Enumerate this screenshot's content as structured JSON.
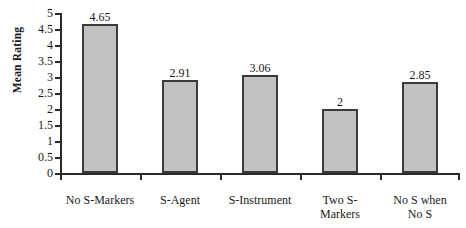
{
  "chart_data": {
    "type": "bar",
    "title": "",
    "xlabel": "",
    "ylabel": "Mean Rating",
    "ylim": [
      0,
      5
    ],
    "ytick_labels": [
      "5",
      "4.5",
      "4",
      "3.5",
      "3",
      "2.5",
      "2",
      "1.5",
      "1",
      "0.5",
      "0"
    ],
    "ytick_values": [
      5,
      4.5,
      4,
      3.5,
      3,
      2.5,
      2,
      1.5,
      1,
      0.5,
      0
    ],
    "grid": false,
    "legend": null,
    "categories": [
      "No S-Markers",
      "S-Agent",
      "S-Instrument",
      "Two S-Markers",
      "No S when No S"
    ],
    "category_lines": [
      [
        "No S-Markers"
      ],
      [
        "S-Agent"
      ],
      [
        "S-Instrument"
      ],
      [
        "Two S-",
        "Markers"
      ],
      [
        "No S when",
        "No S"
      ]
    ],
    "values": [
      4.65,
      2.91,
      3.06,
      2,
      2.85
    ],
    "value_labels": [
      "4.65",
      "2.91",
      "3.06",
      "2",
      "2.85"
    ],
    "bar_fill_color": "#c2c2c2",
    "bar_border_color": "#3a3a3a",
    "axis_color": "#2b2b2b",
    "background_color": "#ffffff"
  }
}
